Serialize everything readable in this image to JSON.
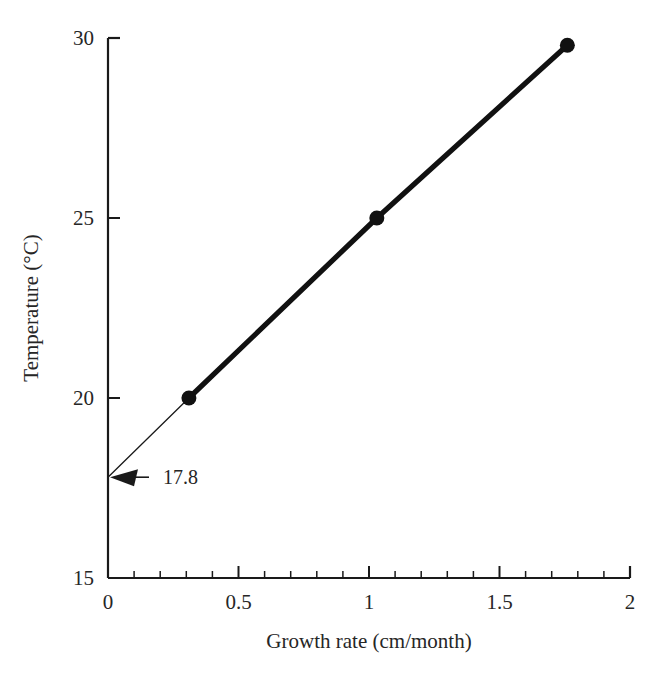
{
  "chart_data": {
    "type": "scatter",
    "title": "",
    "xlabel": "Growth rate (cm/month)",
    "ylabel": "Temperature (°C)",
    "xlim": [
      0,
      2
    ],
    "ylim": [
      15,
      30
    ],
    "grid": false,
    "legend": null,
    "x_major_ticks": [
      0,
      0.5,
      1,
      1.5,
      2
    ],
    "x_tick_labels": [
      "0",
      "0.5",
      "1",
      "1.5",
      "2"
    ],
    "x_minor_tick_step": 0.1,
    "y_major_ticks": [
      15,
      20,
      25,
      30
    ],
    "y_tick_labels": [
      "15",
      "20",
      "25",
      "30"
    ],
    "series": [
      {
        "name": "Temperature vs growth rate",
        "marker": "filled-circle",
        "line": "solid-thick",
        "x": [
          0.31,
          1.03,
          1.76
        ],
        "y": [
          20.0,
          25.0,
          29.8
        ]
      },
      {
        "name": "Extrapolation to zero growth",
        "marker": "none",
        "line": "solid-thin",
        "x": [
          0.0,
          0.31
        ],
        "y": [
          17.8,
          20.0
        ]
      }
    ],
    "annotations": [
      {
        "text": "17.8",
        "kind": "arrow-left",
        "x": 0.0,
        "y": 17.8,
        "label_x": 0.18,
        "label_y": 17.8
      }
    ]
  },
  "axes": {
    "x_axis_name": "growth-rate-axis",
    "y_axis_name": "temperature-axis"
  }
}
